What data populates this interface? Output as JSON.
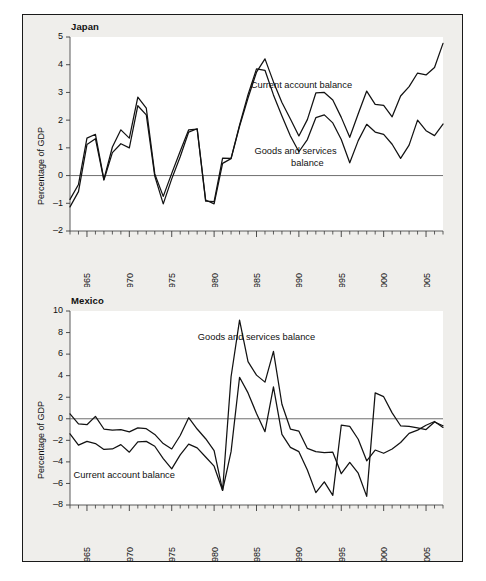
{
  "figure": {
    "background_color": "#efeeeb",
    "line_color": "#121212",
    "frame_color": "#1a1a1a"
  },
  "chart_data": [
    {
      "type": "line",
      "title": "Japan",
      "xlabel": "",
      "ylabel": "Percentage of GDP",
      "xlim": [
        1963,
        2007
      ],
      "ylim": [
        -2,
        5
      ],
      "yticks": [
        -2,
        -1,
        0,
        1,
        2,
        3,
        4,
        5
      ],
      "ytick_labels": [
        "-2",
        "-1",
        "0",
        "1",
        "2",
        "3",
        "4",
        "5"
      ],
      "xticks": [
        1965,
        1970,
        1975,
        1980,
        1985,
        1990,
        1995,
        2000,
        2005
      ],
      "xtick_labels": [
        "1965",
        "1970",
        "1975",
        "1980",
        "1985",
        "1990",
        "1995",
        "2000",
        "2005"
      ],
      "minor_tick_interval": 1,
      "grid": false,
      "zero_line": true,
      "legend": "annotation",
      "annotations": [
        {
          "text": "Current account balance",
          "x": 1990.3,
          "y": 3.15
        },
        {
          "text": "Goods and services",
          "x": 1989.6,
          "y": 0.78
        },
        {
          "text": "balance",
          "x": 1991.0,
          "y": 0.33
        }
      ],
      "x": [
        1963,
        1964,
        1965,
        1966,
        1967,
        1968,
        1969,
        1970,
        1971,
        1972,
        1973,
        1974,
        1975,
        1976,
        1977,
        1978,
        1979,
        1980,
        1981,
        1982,
        1983,
        1984,
        1985,
        1986,
        1987,
        1988,
        1989,
        1990,
        1991,
        1992,
        1993,
        1994,
        1995,
        1996,
        1997,
        1998,
        1999,
        2000,
        2001,
        2002,
        2003,
        2004,
        2005,
        2006,
        2007
      ],
      "series": [
        {
          "name": "Current account balance",
          "values": [
            -1.13,
            -0.58,
            1.12,
            1.33,
            -0.16,
            0.83,
            1.15,
            1.0,
            2.52,
            2.19,
            -0.02,
            -1.02,
            -0.12,
            0.68,
            1.57,
            1.69,
            -0.88,
            -1.02,
            0.44,
            0.61,
            1.78,
            2.8,
            3.73,
            4.21,
            3.38,
            2.64,
            2.04,
            1.43,
            2.02,
            2.98,
            3.0,
            2.73,
            2.1,
            1.38,
            2.23,
            3.05,
            2.57,
            2.53,
            2.12,
            2.87,
            3.21,
            3.7,
            3.63,
            3.9,
            4.77
          ]
        },
        {
          "name": "Goods and services balance",
          "values": [
            -0.86,
            -0.32,
            1.35,
            1.49,
            -0.14,
            1.03,
            1.65,
            1.35,
            2.83,
            2.43,
            0.06,
            -0.75,
            0.08,
            0.88,
            1.65,
            1.68,
            -0.92,
            -0.94,
            0.63,
            0.62,
            1.82,
            2.92,
            3.85,
            3.8,
            2.91,
            2.15,
            1.43,
            0.86,
            1.3,
            2.09,
            2.19,
            1.9,
            1.3,
            0.46,
            1.26,
            1.85,
            1.57,
            1.49,
            1.13,
            0.62,
            1.1,
            2.0,
            1.62,
            1.44,
            1.86
          ]
        }
      ]
    },
    {
      "type": "line",
      "title": "Mexico",
      "xlabel": "",
      "ylabel": "Percentage of GDP",
      "xlim": [
        1963,
        2007
      ],
      "ylim": [
        -8,
        10
      ],
      "yticks": [
        -8,
        -6,
        -4,
        -2,
        0,
        2,
        4,
        6,
        8,
        10
      ],
      "ytick_labels": [
        "-8",
        "-6",
        "-4",
        "-2",
        "0",
        "2",
        "4",
        "6",
        "8",
        "10"
      ],
      "xticks": [
        1965,
        1970,
        1975,
        1980,
        1985,
        1990,
        1995,
        2000,
        2005
      ],
      "xtick_labels": [
        "1965",
        "1970",
        "1975",
        "1980",
        "1985",
        "1990",
        "1995",
        "2000",
        "2005"
      ],
      "minor_tick_interval": 1,
      "grid": false,
      "zero_line": true,
      "legend": "annotation",
      "annotations": [
        {
          "text": "Goods and services balance",
          "x": 1985.0,
          "y": 7.3
        },
        {
          "text": "Current account balance",
          "x": 1969.4,
          "y": -5.5
        }
      ],
      "x": [
        1963,
        1964,
        1965,
        1966,
        1967,
        1968,
        1969,
        1970,
        1971,
        1972,
        1973,
        1974,
        1975,
        1976,
        1977,
        1978,
        1979,
        1980,
        1981,
        1982,
        1983,
        1984,
        1985,
        1986,
        1987,
        1988,
        1989,
        1990,
        1991,
        1992,
        1993,
        1994,
        1995,
        1996,
        1997,
        1998,
        1999,
        2000,
        2001,
        2002,
        2003,
        2004,
        2005,
        2006,
        2007
      ],
      "series": [
        {
          "name": "Goods and services balance",
          "values": [
            0.45,
            -0.48,
            -0.55,
            0.22,
            -0.95,
            -1.05,
            -1.0,
            -1.22,
            -0.85,
            -0.92,
            -1.45,
            -2.3,
            -2.8,
            -1.55,
            0.1,
            -0.95,
            -1.85,
            -2.95,
            -6.65,
            3.9,
            9.15,
            5.3,
            4.05,
            3.4,
            6.25,
            1.35,
            -0.95,
            -1.15,
            -2.75,
            -3.05,
            -3.15,
            -3.1,
            -5.1,
            -4.05,
            -5.05,
            -7.2,
            2.4,
            2.05,
            0.55,
            -0.65,
            -0.7,
            -0.85,
            -1.0,
            -0.3,
            -0.65
          ]
        },
        {
          "name": "Current account balance",
          "values": [
            -1.4,
            -2.45,
            -2.1,
            -2.3,
            -2.85,
            -2.8,
            -2.4,
            -3.1,
            -2.15,
            -2.1,
            -2.55,
            -3.7,
            -4.65,
            -3.35,
            -2.35,
            -2.7,
            -3.55,
            -4.4,
            -6.65,
            -3.05,
            3.85,
            2.4,
            0.5,
            -1.2,
            2.95,
            -1.45,
            -2.65,
            -3.05,
            -4.75,
            -6.85,
            -5.85,
            -7.1,
            -0.6,
            -0.7,
            -1.9,
            -3.9,
            -2.9,
            -3.2,
            -2.8,
            -2.2,
            -1.35,
            -1.05,
            -0.6,
            -0.25,
            -0.8
          ]
        }
      ]
    }
  ]
}
